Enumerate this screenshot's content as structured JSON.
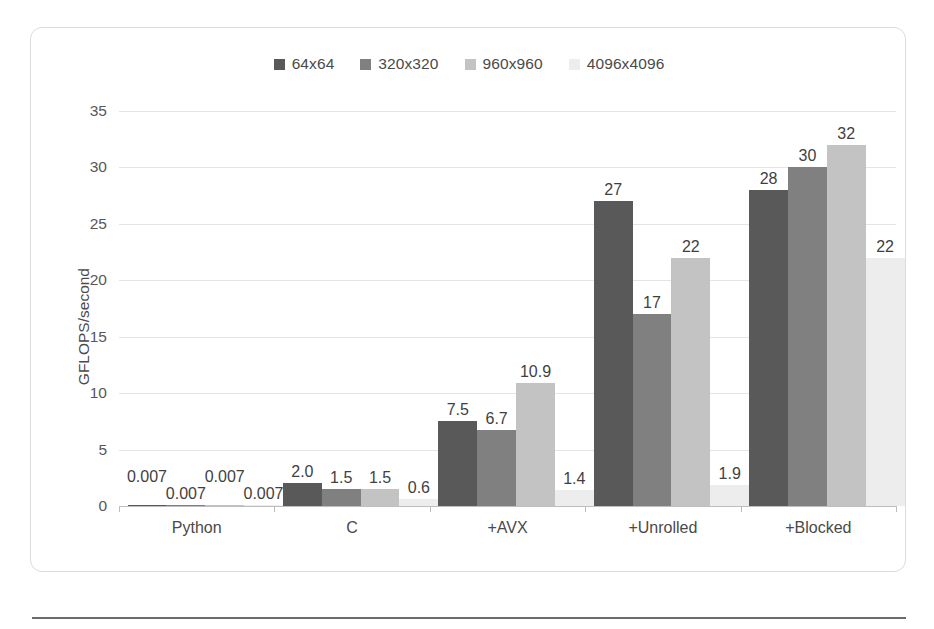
{
  "chart_data": {
    "type": "bar",
    "title": "",
    "xlabel": "",
    "ylabel": "GFLOPS/second",
    "ylim": [
      0,
      35
    ],
    "yticks": [
      0,
      5,
      10,
      15,
      20,
      25,
      30,
      35
    ],
    "grid": true,
    "legend_position": "top-center",
    "categories": [
      "Python",
      "C",
      "+AVX",
      "+Unrolled",
      "+Blocked"
    ],
    "series": [
      {
        "name": "64x64",
        "color": "#595959",
        "values": [
          0.007,
          2.0,
          7.5,
          27,
          28
        ],
        "labels": [
          "0.007",
          "2.0",
          "7.5",
          "27",
          "28"
        ]
      },
      {
        "name": "320x320",
        "color": "#808080",
        "values": [
          0.007,
          1.5,
          6.7,
          17,
          30
        ],
        "labels": [
          "0.007",
          "1.5",
          "6.7",
          "17",
          "30"
        ]
      },
      {
        "name": "960x960",
        "color": "#c3c3c3",
        "values": [
          0.007,
          1.5,
          10.9,
          22,
          32
        ],
        "labels": [
          "0.007",
          "1.5",
          "10.9",
          "22",
          "32"
        ]
      },
      {
        "name": "4096x4096",
        "color": "#ededed",
        "values": [
          0.007,
          0.6,
          1.4,
          1.9,
          22
        ],
        "labels": [
          "0.007",
          "0.6",
          "1.4",
          "1.9",
          "22"
        ]
      }
    ]
  },
  "legend": {
    "items": [
      {
        "label": "64x64",
        "color": "#595959"
      },
      {
        "label": "320x320",
        "color": "#808080"
      },
      {
        "label": "960x960",
        "color": "#c3c3c3"
      },
      {
        "label": "4096x4096",
        "color": "#ededed"
      }
    ]
  },
  "axes": {
    "y_title": "GFLOPS/second",
    "y_ticks": [
      "0",
      "5",
      "10",
      "15",
      "20",
      "25",
      "30",
      "35"
    ],
    "x_labels": [
      "Python",
      "C",
      "+AVX",
      "+Unrolled",
      "+Blocked"
    ]
  }
}
